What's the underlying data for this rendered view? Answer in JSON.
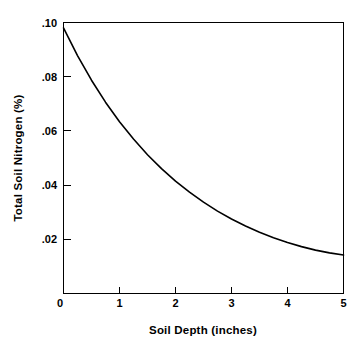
{
  "chart_data": {
    "type": "line",
    "title": "",
    "xlabel": "Soil Depth (inches)",
    "ylabel": "Total Soil Nitrogen (%)",
    "xlim": [
      0,
      5
    ],
    "ylim": [
      0,
      0.1
    ],
    "grid": false,
    "legend": null,
    "xticks": [
      "0",
      "1",
      "2",
      "3",
      "4",
      "5"
    ],
    "xtick_values": [
      0,
      1,
      2,
      3,
      4,
      5
    ],
    "yticks": [
      "0",
      ".02",
      ".04",
      ".06",
      ".08",
      ".10"
    ],
    "ytick_values": [
      0,
      0.02,
      0.04,
      0.06,
      0.08,
      0.1
    ],
    "series": [
      {
        "name": "Total Soil Nitrogen",
        "x": [
          0,
          0.25,
          0.5,
          0.75,
          1.0,
          1.25,
          1.5,
          1.75,
          2.0,
          2.25,
          2.5,
          2.75,
          3.0,
          3.25,
          3.5,
          3.75,
          4.0,
          4.25,
          4.5,
          4.75,
          5.0
        ],
        "values": [
          0.098,
          0.0878,
          0.0787,
          0.0706,
          0.0634,
          0.057,
          0.0512,
          0.0461,
          0.0415,
          0.0374,
          0.0337,
          0.0304,
          0.0275,
          0.0249,
          0.0226,
          0.0206,
          0.0188,
          0.0173,
          0.016,
          0.015,
          0.0142
        ]
      }
    ]
  },
  "axes": {
    "x_title": "Soil Depth (inches)",
    "y_title": "Total Soil Nitrogen (%)"
  }
}
